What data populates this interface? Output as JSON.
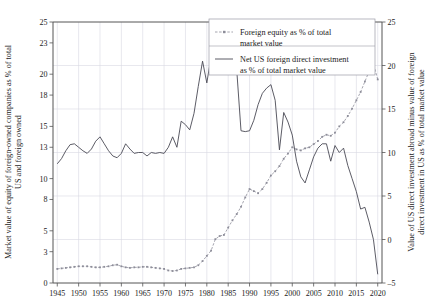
{
  "chart_data": {
    "type": "line",
    "title": "",
    "xlabel": "",
    "ylabel": "Market value of equity of foreign-owned companies as % of total US and foreign owned",
    "y2label": "Value of US direct investment abroad minus value of foreign direct investment in US as % of total market value",
    "xlim": [
      1944,
      2021
    ],
    "ylim": [
      0,
      25
    ],
    "y2lim": [
      -5,
      25
    ],
    "grid": true,
    "legend_position": "top-right",
    "xticks": [
      1945,
      1950,
      1955,
      1960,
      1965,
      1970,
      1975,
      1980,
      1985,
      1990,
      1995,
      2000,
      2005,
      2010,
      2015,
      2020
    ],
    "yticks": [
      0,
      3,
      5,
      8,
      10,
      13,
      15,
      18,
      20,
      23,
      25
    ],
    "y2ticks": [
      -5,
      0,
      5,
      10,
      15,
      20,
      25
    ],
    "colors": {
      "solid": "#4a4a55",
      "dashed": "#8d8d99",
      "grid": "#d8d8e2",
      "axis": "#555555"
    },
    "series": [
      {
        "name": "Foreign equity as % of total market value",
        "axis": "left",
        "style": "dashed-markers",
        "x": [
          1945,
          1946,
          1947,
          1948,
          1949,
          1950,
          1951,
          1952,
          1953,
          1954,
          1955,
          1956,
          1957,
          1958,
          1959,
          1960,
          1961,
          1962,
          1963,
          1964,
          1965,
          1966,
          1967,
          1968,
          1969,
          1970,
          1971,
          1972,
          1973,
          1974,
          1975,
          1976,
          1977,
          1978,
          1979,
          1980,
          1981,
          1982,
          1983,
          1984,
          1985,
          1986,
          1987,
          1988,
          1989,
          1990,
          1991,
          1992,
          1993,
          1994,
          1995,
          1996,
          1997,
          1998,
          1999,
          2000,
          2001,
          2002,
          2003,
          2004,
          2005,
          2006,
          2007,
          2008,
          2009,
          2010,
          2011,
          2012,
          2013,
          2014,
          2015,
          2016,
          2017,
          2018,
          2019,
          2020
        ],
        "values": [
          1.35,
          1.4,
          1.45,
          1.5,
          1.55,
          1.6,
          1.6,
          1.6,
          1.55,
          1.5,
          1.5,
          1.55,
          1.6,
          1.7,
          1.75,
          1.6,
          1.5,
          1.45,
          1.5,
          1.5,
          1.55,
          1.55,
          1.5,
          1.45,
          1.4,
          1.35,
          1.2,
          1.15,
          1.2,
          1.35,
          1.4,
          1.45,
          1.5,
          1.7,
          2.1,
          2.6,
          3.1,
          4.2,
          4.5,
          4.6,
          5.3,
          6.0,
          6.6,
          7.3,
          8.2,
          9.0,
          8.8,
          8.6,
          9.0,
          9.6,
          10.3,
          10.7,
          11.2,
          11.9,
          12.4,
          13.0,
          12.8,
          12.7,
          12.9,
          13.0,
          13.3,
          13.6,
          14.0,
          14.2,
          14.1,
          14.4,
          15.0,
          15.4,
          16.0,
          16.7,
          17.5,
          18.3,
          19.3,
          20.3,
          21.0,
          19.5
        ]
      },
      {
        "name": "Net US foreign direct investment as % of total market value",
        "axis": "right",
        "style": "solid",
        "x": [
          1945,
          1946,
          1947,
          1948,
          1949,
          1950,
          1951,
          1952,
          1953,
          1954,
          1955,
          1956,
          1957,
          1958,
          1959,
          1960,
          1961,
          1962,
          1963,
          1964,
          1965,
          1966,
          1967,
          1968,
          1969,
          1970,
          1971,
          1972,
          1973,
          1974,
          1975,
          1976,
          1977,
          1978,
          1979,
          1980,
          1981,
          1982,
          1983,
          1984,
          1985,
          1986,
          1987,
          1988,
          1989,
          1990,
          1991,
          1992,
          1993,
          1994,
          1995,
          1996,
          1997,
          1998,
          1999,
          2000,
          2001,
          2002,
          2003,
          2004,
          2005,
          2006,
          2007,
          2008,
          2009,
          2010,
          2011,
          2012,
          2013,
          2014,
          2015,
          2016,
          2017,
          2018,
          2019,
          2020
        ],
        "values": [
          8.7,
          9.3,
          10.2,
          10.9,
          11.0,
          10.6,
          10.2,
          9.9,
          10.4,
          11.3,
          11.8,
          11.0,
          10.2,
          9.6,
          9.4,
          9.9,
          11.0,
          10.4,
          9.9,
          10.0,
          10.0,
          9.6,
          10.0,
          9.9,
          10.0,
          9.9,
          10.6,
          11.8,
          10.6,
          13.6,
          13.2,
          12.6,
          14.5,
          17.6,
          20.5,
          18.0,
          21.0,
          23.4,
          24.5,
          23.0,
          21.5,
          22.2,
          19.5,
          12.5,
          12.4,
          12.5,
          13.7,
          15.5,
          16.8,
          17.4,
          17.8,
          16.0,
          10.3,
          14.6,
          13.5,
          12.0,
          9.0,
          7.2,
          6.5,
          8.0,
          9.5,
          10.5,
          11.0,
          11.0,
          9.0,
          10.8,
          10.0,
          10.5,
          8.5,
          7.0,
          5.5,
          3.5,
          3.7,
          2.0,
          0.0,
          -4.0
        ]
      }
    ]
  },
  "legend": {
    "items": [
      {
        "label_line1": "Foreign equity as % of total",
        "label_line2": "market value",
        "style": "dashed-markers"
      },
      {
        "label_line1": "Net US foreign direct investment",
        "label_line2": "as % of total market value",
        "style": "solid"
      }
    ]
  }
}
